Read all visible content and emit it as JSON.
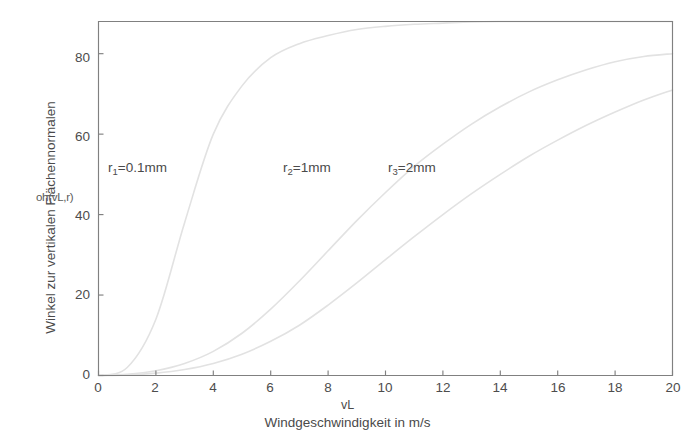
{
  "chart_data": {
    "type": "line",
    "title": "",
    "xlabel": "Windgeschwindigkeit in m/s",
    "xvar": "vL",
    "ylabel": "Winkel zur vertikalen Flächennormalen",
    "yvar": "oh(vL,r)",
    "xlim": [
      0,
      20
    ],
    "ylim": [
      0,
      88
    ],
    "grid": false,
    "legend_position": "inline-annotations",
    "xticks": [
      0,
      2,
      4,
      6,
      8,
      10,
      12,
      14,
      16,
      18,
      20
    ],
    "yticks": [
      0,
      20,
      40,
      60,
      80
    ],
    "xtick_labels": [
      "0",
      "2",
      "4",
      "6",
      "8",
      "10",
      "12",
      "14",
      "16",
      "18",
      "20"
    ],
    "ytick_labels": [
      "0",
      "20",
      "40",
      "60",
      "80"
    ],
    "line_color": "#e2e2e2",
    "axis_color": "#808080",
    "background": "#ffffff",
    "x": [
      0,
      1,
      2,
      3,
      4,
      5,
      6,
      7,
      8,
      9,
      10,
      11,
      12,
      13,
      14,
      15,
      16,
      17,
      18,
      19,
      20
    ],
    "series": [
      {
        "name": "r1 = 0.1 mm",
        "label_text": "r1=0.1mm",
        "label_sub": "1",
        "label_rest": "=0.1mm",
        "values": [
          0,
          2,
          14,
          38,
          60,
          72,
          79,
          82.5,
          84.5,
          86,
          86.8,
          87.3,
          87.6,
          87.9,
          88,
          88,
          88,
          88,
          88,
          88,
          88
        ]
      },
      {
        "name": "r2 = 1 mm",
        "label_text": "r2=1mm",
        "label_sub": "2",
        "label_rest": "=1mm",
        "values": [
          0,
          0.3,
          1.2,
          3.0,
          6.0,
          10.5,
          16.5,
          23.5,
          31.0,
          38.5,
          45.5,
          52.0,
          57.5,
          62.5,
          66.8,
          70.5,
          73.5,
          76.0,
          78.0,
          79.3,
          80.0
        ]
      },
      {
        "name": "r3 = 2 mm",
        "label_text": "r3=2mm",
        "label_sub": "3",
        "label_rest": "=2mm",
        "values": [
          0,
          0.15,
          0.6,
          1.5,
          3.0,
          5.3,
          8.5,
          12.5,
          17.5,
          23.0,
          28.8,
          34.5,
          40.0,
          45.2,
          50.0,
          54.5,
          58.5,
          62.2,
          65.5,
          68.5,
          71.0
        ]
      }
    ],
    "annotations": [
      {
        "name": "label-r1",
        "x_px": 108,
        "y_px": 160
      },
      {
        "name": "label-r2",
        "x_px": 283,
        "y_px": 160
      },
      {
        "name": "label-r3",
        "x_px": 388,
        "y_px": 160
      }
    ]
  }
}
